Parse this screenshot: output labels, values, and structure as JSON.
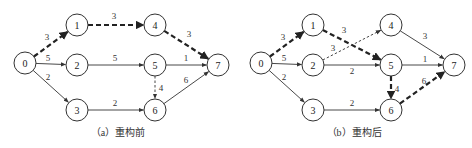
{
  "diagrams": [
    {
      "caption": "（a）重构前",
      "offset_x": 0,
      "nodes": [
        {
          "id": "0",
          "x": 25,
          "y": 63
        },
        {
          "id": "1",
          "x": 77,
          "y": 25
        },
        {
          "id": "2",
          "x": 77,
          "y": 65
        },
        {
          "id": "3",
          "x": 77,
          "y": 110
        },
        {
          "id": "4",
          "x": 155,
          "y": 25
        },
        {
          "id": "5",
          "x": 155,
          "y": 65
        },
        {
          "id": "6",
          "x": 155,
          "y": 110
        },
        {
          "id": "7",
          "x": 218,
          "y": 65
        }
      ],
      "edges": [
        {
          "from": "0",
          "to": "1",
          "weight": "3",
          "style": "critical",
          "lx": 47,
          "ly": 40
        },
        {
          "from": "1",
          "to": "4",
          "weight": "3",
          "style": "critical",
          "lx": 114,
          "ly": 19
        },
        {
          "from": "4",
          "to": "7",
          "weight": "3",
          "style": "critical",
          "lx": 189,
          "ly": 37
        },
        {
          "from": "0",
          "to": "2",
          "weight": "5",
          "style": "solid",
          "lx": 48,
          "ly": 61
        },
        {
          "from": "2",
          "to": "5",
          "weight": "5",
          "style": "solid",
          "lx": 115,
          "ly": 61
        },
        {
          "from": "5",
          "to": "7",
          "weight": "1",
          "style": "solid",
          "lx": 186,
          "ly": 61
        },
        {
          "from": "0",
          "to": "3",
          "weight": "2",
          "style": "solid",
          "lx": 48,
          "ly": 80
        },
        {
          "from": "3",
          "to": "6",
          "weight": "2",
          "style": "solid",
          "lx": 115,
          "ly": 106
        },
        {
          "from": "5",
          "to": "6",
          "weight": "4",
          "style": "dashed",
          "lx": 161,
          "ly": 91
        },
        {
          "from": "6",
          "to": "7",
          "weight": "6",
          "style": "solid",
          "lx": 186,
          "ly": 83
        }
      ]
    },
    {
      "caption": "（b）重构后",
      "offset_x": 236,
      "nodes": [
        {
          "id": "0",
          "x": 25,
          "y": 63
        },
        {
          "id": "1",
          "x": 77,
          "y": 25
        },
        {
          "id": "2",
          "x": 77,
          "y": 65
        },
        {
          "id": "3",
          "x": 77,
          "y": 110
        },
        {
          "id": "4",
          "x": 155,
          "y": 25
        },
        {
          "id": "5",
          "x": 155,
          "y": 65
        },
        {
          "id": "6",
          "x": 155,
          "y": 110
        },
        {
          "id": "7",
          "x": 218,
          "y": 65
        }
      ],
      "edges": [
        {
          "from": "0",
          "to": "1",
          "weight": "3",
          "style": "critical",
          "lx": 47,
          "ly": 40
        },
        {
          "from": "1",
          "to": "5",
          "weight": "3",
          "style": "critical",
          "lx": 108,
          "ly": 33
        },
        {
          "from": "2",
          "to": "4",
          "weight": "3",
          "style": "dashed",
          "lx": 97,
          "ly": 51
        },
        {
          "from": "4",
          "to": "7",
          "weight": "3",
          "style": "solid",
          "lx": 189,
          "ly": 39
        },
        {
          "from": "0",
          "to": "2",
          "weight": "5",
          "style": "solid",
          "lx": 48,
          "ly": 61
        },
        {
          "from": "2",
          "to": "5",
          "weight": "2",
          "style": "solid",
          "lx": 116,
          "ly": 74
        },
        {
          "from": "5",
          "to": "7",
          "weight": "1",
          "style": "solid",
          "lx": 189,
          "ly": 62
        },
        {
          "from": "0",
          "to": "3",
          "weight": "2",
          "style": "solid",
          "lx": 48,
          "ly": 80
        },
        {
          "from": "3",
          "to": "6",
          "weight": "2",
          "style": "solid",
          "lx": 116,
          "ly": 106
        },
        {
          "from": "5",
          "to": "6",
          "weight": "4",
          "style": "critical",
          "lx": 161,
          "ly": 92
        },
        {
          "from": "6",
          "to": "7",
          "weight": "6",
          "style": "critical",
          "lx": 188,
          "ly": 84
        }
      ]
    }
  ],
  "node_radius": 11,
  "colors": {
    "stroke": "#333333",
    "critical": "#222222"
  }
}
